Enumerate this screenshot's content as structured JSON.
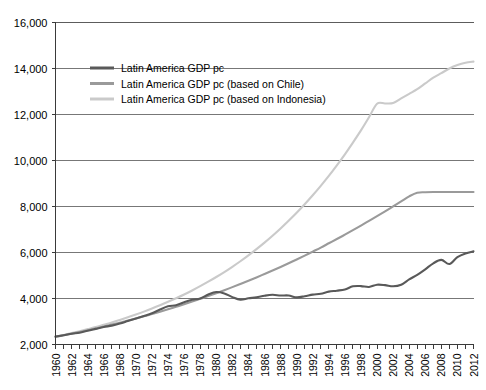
{
  "chart_data": {
    "type": "line",
    "title": "",
    "subtitle": "",
    "xlabel": "",
    "ylabel": "",
    "xlim": [
      1960,
      2012
    ],
    "ylim": [
      2000,
      16000
    ],
    "ytick_values": [
      2000,
      4000,
      6000,
      8000,
      10000,
      12000,
      14000,
      16000
    ],
    "ytick_labels": [
      "2,000",
      "4,000",
      "6,000",
      "8,000",
      "10,000",
      "12,000",
      "14,000",
      "16,000"
    ],
    "xtick_labels": [
      "1960",
      "1962",
      "1964",
      "1966",
      "1968",
      "1970",
      "1972",
      "1974",
      "1976",
      "1978",
      "1980",
      "1982",
      "1984",
      "1986",
      "1988",
      "1990",
      "1992",
      "1994",
      "1996",
      "1998",
      "2000",
      "2002",
      "2004",
      "2006",
      "2008",
      "2010",
      "2012"
    ],
    "xtick_label_step": 2,
    "minor_tick_step": 1,
    "grid": "horizontal",
    "legend_position": "top-left-inside",
    "x": [
      1960,
      1961,
      1962,
      1963,
      1964,
      1965,
      1966,
      1967,
      1968,
      1969,
      1970,
      1971,
      1972,
      1973,
      1974,
      1975,
      1976,
      1977,
      1978,
      1979,
      1980,
      1981,
      1982,
      1983,
      1984,
      1985,
      1986,
      1987,
      1988,
      1989,
      1990,
      1991,
      1992,
      1993,
      1994,
      1995,
      1996,
      1997,
      1998,
      1999,
      2000,
      2001,
      2002,
      2003,
      2004,
      2005,
      2006,
      2007,
      2008,
      2009,
      2010,
      2011,
      2012
    ],
    "series": [
      {
        "name": "Latin America GDP pc",
        "color": "#595959",
        "width": 2.1,
        "values": [
          2350,
          2400,
          2470,
          2510,
          2600,
          2680,
          2760,
          2820,
          2910,
          3020,
          3130,
          3240,
          3360,
          3520,
          3660,
          3710,
          3840,
          3950,
          4000,
          4170,
          4280,
          4220,
          4060,
          3950,
          4010,
          4050,
          4120,
          4160,
          4130,
          4130,
          4050,
          4100,
          4170,
          4210,
          4300,
          4340,
          4390,
          4530,
          4540,
          4500,
          4600,
          4580,
          4530,
          4600,
          4830,
          5030,
          5270,
          5530,
          5680,
          5500,
          5800,
          5960,
          6050
        ]
      },
      {
        "name": "Latin America GDP pc (based on Chile)",
        "color": "#9a9a9a",
        "width": 2.1,
        "values": [
          2330,
          2400,
          2470,
          2545,
          2620,
          2700,
          2780,
          2865,
          2950,
          3040,
          3130,
          3225,
          3325,
          3425,
          3530,
          3640,
          3750,
          3865,
          3985,
          4105,
          4230,
          4360,
          4495,
          4630,
          4770,
          4915,
          5065,
          5215,
          5370,
          5530,
          5695,
          5865,
          6040,
          6215,
          6400,
          6585,
          6775,
          6970,
          7170,
          7375,
          7580,
          7790,
          8005,
          8220,
          8440,
          8600,
          8620,
          8630,
          8630,
          8630,
          8630,
          8630,
          8630
        ]
      },
      {
        "name": "Latin America GDP pc (based on Indonesia)",
        "color": "#cacaca",
        "width": 2.1,
        "values": [
          2340,
          2415,
          2495,
          2580,
          2670,
          2760,
          2860,
          2960,
          3070,
          3185,
          3305,
          3430,
          3565,
          3705,
          3855,
          4010,
          4175,
          4350,
          4535,
          4730,
          4935,
          5150,
          5380,
          5620,
          5875,
          6145,
          6430,
          6730,
          7045,
          7380,
          7730,
          8100,
          8490,
          8900,
          9330,
          9790,
          10270,
          10780,
          11310,
          11880,
          12470,
          12480,
          12500,
          12700,
          12900,
          13100,
          13350,
          13600,
          13800,
          14000,
          14150,
          14250,
          14300
        ]
      }
    ]
  },
  "legend": {
    "items": [
      {
        "label": "Latin America GDP pc",
        "color": "#595959"
      },
      {
        "label": "Latin America GDP pc (based on Chile)",
        "color": "#9a9a9a"
      },
      {
        "label": "Latin America GDP pc (based on Indonesia)",
        "color": "#cacaca"
      }
    ]
  }
}
